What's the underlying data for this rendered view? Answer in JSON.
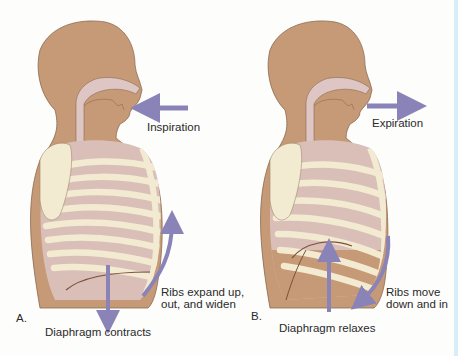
{
  "panels": [
    {
      "id": "A",
      "letter": "A.",
      "airflow_label": "Inspiration",
      "airflow_direction": "in",
      "diaphragm_label": "Diaphragm contracts",
      "diaphragm_direction": "down",
      "ribs_label_line1": "Ribs expand up,",
      "ribs_label_line2": "out, and widen",
      "ribs_direction": "up-out"
    },
    {
      "id": "B",
      "letter": "B.",
      "airflow_label": "Expiration",
      "airflow_direction": "out",
      "diaphragm_label": "Diaphragm relaxes",
      "diaphragm_direction": "up",
      "ribs_label_line1": "Ribs move",
      "ribs_label_line2": "down and in",
      "ribs_direction": "down-in"
    }
  ],
  "colors": {
    "skin": "#c69a76",
    "skin_outline": "#8a6a50",
    "airway": "#ddc6c3",
    "lung": "#d9bfb8",
    "rib": "#f3ead2",
    "rib_outline": "#9b8a6a",
    "arrow": "#8a83b8",
    "diaphragm_line": "#7a5038",
    "edge": "#d6eef6"
  }
}
